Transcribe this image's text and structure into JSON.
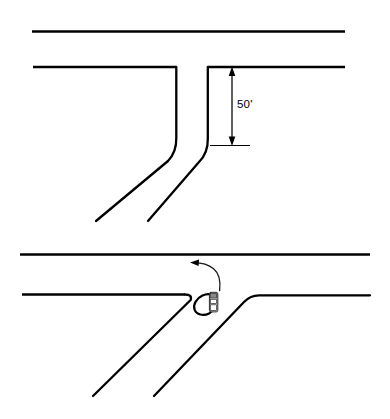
{
  "diagram": {
    "background_color": "#ffffff",
    "line_color": "#000000",
    "panels": [
      {
        "id": "upper-panel",
        "name": "existing-geometry-panel",
        "label": "",
        "dimension": {
          "value": "50'",
          "units": "feet",
          "numeric": 50,
          "orientation": "vertical",
          "from_y": 67,
          "to_y": 145
        }
      },
      {
        "id": "lower-panel",
        "name": "proposed-geometry-panel",
        "label": "",
        "vehicle": {
          "name": "truck-icon",
          "body_color": "#d9d9d9",
          "outline_color": "#2b2b2b",
          "heading": "north"
        },
        "movement": {
          "name": "left-turn-arrow",
          "direction": "left-turn",
          "arrow_color": "#1a1a1a"
        },
        "swept_path": {
          "name": "trailer-swept-path",
          "shape": "teardrop"
        }
      }
    ]
  },
  "labels": {
    "dimension_50": "50'"
  },
  "colors": {
    "stroke": "#000000",
    "background": "#ffffff",
    "vehicle_fill": "#d9d9d9",
    "arrow": "#1a1a1a"
  }
}
